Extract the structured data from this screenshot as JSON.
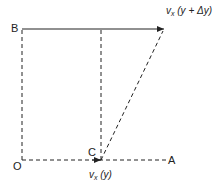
{
  "diagram": {
    "type": "velocity-shear-geometry",
    "points": {
      "O": {
        "label": "O"
      },
      "A": {
        "label": "A"
      },
      "B": {
        "label": "B"
      },
      "C": {
        "label": "C"
      }
    },
    "labels": {
      "top_velocity_main": "v",
      "top_velocity_sub": "x",
      "top_velocity_arg": " (y + Δy)",
      "bottom_velocity_main": "v",
      "bottom_velocity_sub": "x",
      "bottom_velocity_arg": " (y)"
    },
    "colors": {
      "line": "#222222",
      "background": "#ffffff"
    }
  }
}
